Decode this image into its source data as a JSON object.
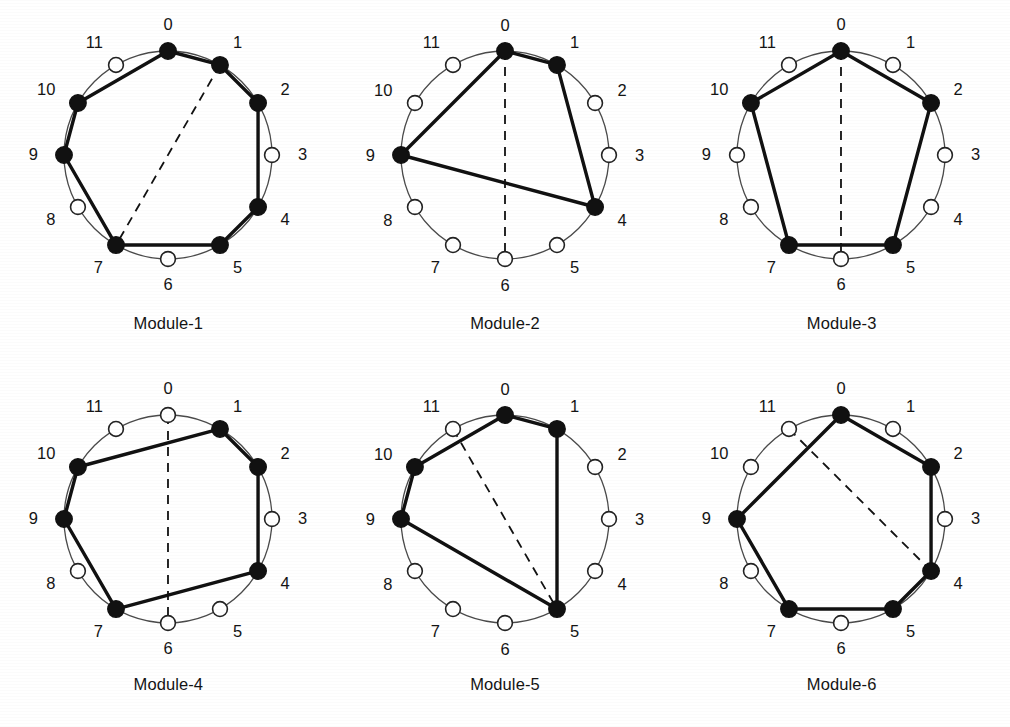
{
  "figure": {
    "type": "graph-diagram-grid",
    "columns": 3,
    "rows": 2,
    "node_count": 12,
    "node_positions": [
      "0",
      "1",
      "2",
      "3",
      "4",
      "5",
      "6",
      "7",
      "8",
      "9",
      "10",
      "11"
    ],
    "colors": {
      "filled_node": "#111111",
      "empty_node_fill": "#ffffff",
      "empty_node_stroke": "#222222",
      "ring": "#4a4a4a",
      "solid_edge": "#111111",
      "dashed_edge": "#111111",
      "background": "#ffffff",
      "label": "#141414"
    }
  },
  "modules": [
    {
      "caption": "Module-1",
      "filled": [
        0,
        1,
        2,
        4,
        5,
        7,
        9,
        10
      ],
      "empty": [
        3,
        6,
        8,
        11
      ],
      "solid_edges": [
        [
          10,
          0
        ],
        [
          0,
          1
        ],
        [
          1,
          2
        ],
        [
          2,
          4
        ],
        [
          4,
          5
        ],
        [
          5,
          7
        ],
        [
          7,
          9
        ],
        [
          9,
          10
        ]
      ],
      "dashed_edges": [
        [
          1,
          7
        ]
      ]
    },
    {
      "caption": "Module-2",
      "filled": [
        0,
        1,
        4,
        9
      ],
      "empty": [
        2,
        3,
        5,
        6,
        7,
        8,
        10,
        11
      ],
      "solid_edges": [
        [
          9,
          0
        ],
        [
          0,
          1
        ],
        [
          1,
          4
        ],
        [
          4,
          9
        ]
      ],
      "dashed_edges": [
        [
          0,
          6
        ]
      ]
    },
    {
      "caption": "Module-3",
      "filled": [
        0,
        2,
        5,
        7,
        10
      ],
      "empty": [
        1,
        3,
        4,
        6,
        8,
        9,
        11
      ],
      "solid_edges": [
        [
          10,
          0
        ],
        [
          0,
          2
        ],
        [
          2,
          5
        ],
        [
          5,
          7
        ],
        [
          7,
          10
        ]
      ],
      "dashed_edges": [
        [
          0,
          6
        ]
      ]
    },
    {
      "caption": "Module-4",
      "filled": [
        1,
        2,
        4,
        7,
        9,
        10
      ],
      "empty": [
        0,
        3,
        5,
        6,
        8,
        11
      ],
      "solid_edges": [
        [
          10,
          1
        ],
        [
          1,
          2
        ],
        [
          2,
          4
        ],
        [
          4,
          7
        ],
        [
          7,
          9
        ],
        [
          9,
          10
        ]
      ],
      "dashed_edges": [
        [
          0,
          6
        ]
      ]
    },
    {
      "caption": "Module-5",
      "filled": [
        0,
        1,
        5,
        9,
        10
      ],
      "empty": [
        2,
        3,
        4,
        6,
        7,
        8,
        11
      ],
      "solid_edges": [
        [
          10,
          0
        ],
        [
          0,
          1
        ],
        [
          1,
          5
        ],
        [
          5,
          9
        ],
        [
          9,
          10
        ]
      ],
      "dashed_edges": [
        [
          11,
          5
        ]
      ]
    },
    {
      "caption": "Module-6",
      "filled": [
        0,
        2,
        4,
        5,
        7,
        9
      ],
      "empty": [
        1,
        3,
        6,
        8,
        10,
        11
      ],
      "solid_edges": [
        [
          9,
          0
        ],
        [
          0,
          2
        ],
        [
          2,
          4
        ],
        [
          4,
          5
        ],
        [
          5,
          7
        ],
        [
          7,
          9
        ]
      ],
      "dashed_edges": [
        [
          11,
          4
        ]
      ]
    }
  ]
}
